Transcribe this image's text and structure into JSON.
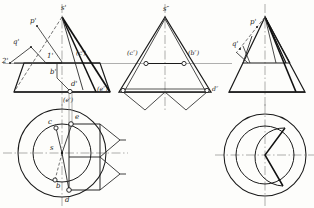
{
  "drawing": {
    "title": "Orthographic projection of cone with auxiliary points",
    "type": "descriptive-geometry",
    "line_colors": {
      "visible": "#1a1a1a",
      "hidden": "#555555",
      "center": "#7a7a7a",
      "projection": "#8e8e8e",
      "accent": "#111111"
    }
  },
  "views": {
    "front_left": {
      "name": "front-view-left",
      "labels": [
        {
          "id": "s-prime",
          "text": "s'",
          "x": 61,
          "y": 8
        },
        {
          "id": "p-prime",
          "text": "p'",
          "x": 33,
          "y": 22
        },
        {
          "id": "q-prime",
          "text": "q'",
          "x": 16,
          "y": 42
        },
        {
          "id": "two-prime",
          "text": "2'",
          "x": 8,
          "y": 60
        },
        {
          "id": "one-prime",
          "text": "1'",
          "x": 47,
          "y": 56
        },
        {
          "id": "b-prime",
          "text": "b'",
          "x": 50,
          "y": 70
        },
        {
          "id": "d-prime",
          "text": "d'",
          "x": 74,
          "y": 84
        },
        {
          "id": "c-prime",
          "text": "(c')",
          "x": 82,
          "y": 53
        },
        {
          "id": "e-prime",
          "text": "(e')",
          "x": 68,
          "y": 99
        }
      ]
    },
    "front_mid": {
      "name": "front-view-middle",
      "labels": [
        {
          "id": "s-dprime",
          "text": "s″",
          "x": 163,
          "y": 9
        },
        {
          "id": "c-dprime",
          "text": "(c″)",
          "x": 134,
          "y": 53
        },
        {
          "id": "b-dprime",
          "text": "(b″)",
          "x": 186,
          "y": 53
        },
        {
          "id": "e-dprime",
          "text": "(e″)",
          "x": 122,
          "y": 89
        },
        {
          "id": "d-dprime",
          "text": "d″",
          "x": 200,
          "y": 89
        }
      ]
    },
    "side_right": {
      "name": "side-view-right",
      "labels": [
        {
          "id": "p-dprime",
          "text": "p'",
          "x": 253,
          "y": 22
        },
        {
          "id": "q-dprime",
          "text": "q'",
          "x": 236,
          "y": 44
        }
      ]
    },
    "top_left": {
      "name": "top-view-left",
      "labels": [
        {
          "id": "e-top",
          "text": "e",
          "x": 75,
          "y": 117
        },
        {
          "id": "c-top",
          "text": "c",
          "x": 48,
          "y": 128
        },
        {
          "id": "s-top",
          "text": "s",
          "x": 47,
          "y": 146
        },
        {
          "id": "b-top",
          "text": "b",
          "x": 58,
          "y": 185
        },
        {
          "id": "d-top",
          "text": "d",
          "x": 66,
          "y": 199
        }
      ]
    },
    "top_right": {
      "name": "top-view-right",
      "labels": []
    }
  },
  "geometry": {
    "front_left": {
      "apex": [
        62,
        17
      ],
      "base_left": [
        14,
        92
      ],
      "base_right": [
        110,
        92
      ],
      "trunc_left": [
        24,
        63
      ],
      "trunc_right": [
        100,
        63
      ],
      "axis_x": 62,
      "axis_top": 5,
      "axis_bottom": 104
    },
    "front_mid": {
      "apex": [
        165,
        17
      ],
      "base_left": [
        119,
        92
      ],
      "base_right": [
        211,
        92
      ],
      "axis_x": 165
    },
    "side_right": {
      "apex": [
        265,
        17
      ],
      "base_left": [
        229,
        92
      ],
      "base_right": [
        305,
        92
      ],
      "axis_x": 265
    },
    "top_left": {
      "center": [
        62,
        153
      ],
      "r_outer": 44,
      "r_inner": 29
    },
    "top_right": {
      "center": [
        265,
        155
      ],
      "r_outer": 41,
      "r_inner": 29
    }
  }
}
